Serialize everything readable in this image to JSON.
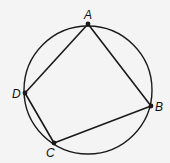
{
  "diagram": {
    "circle": {
      "cx": 88,
      "cy": 90,
      "r": 64
    },
    "points": [
      {
        "label": "A",
        "x": 88,
        "y": 24,
        "lx": 84,
        "ly": 19
      },
      {
        "label": "B",
        "x": 151,
        "y": 106,
        "lx": 155,
        "ly": 111
      },
      {
        "label": "C",
        "x": 54,
        "y": 143,
        "lx": 46,
        "ly": 157
      },
      {
        "label": "D",
        "x": 25,
        "y": 93,
        "lx": 12,
        "ly": 98
      }
    ],
    "edges": [
      [
        "A",
        "B"
      ],
      [
        "B",
        "C"
      ],
      [
        "C",
        "D"
      ],
      [
        "D",
        "A"
      ]
    ],
    "stroke_color": "#1a1a1a"
  }
}
